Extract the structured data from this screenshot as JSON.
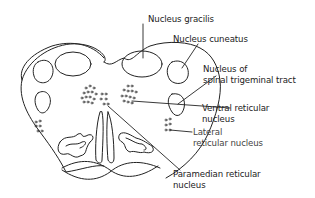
{
  "figure": {
    "type": "anatomical cross-section",
    "stroke_color": "#222222",
    "background": "#ffffff"
  },
  "labels": [
    {
      "id": "gracilis",
      "lines": [
        "Nucleus gracilis"
      ]
    },
    {
      "id": "cuneatus",
      "lines": [
        "Nucleus cuneatus"
      ]
    },
    {
      "id": "spinal-trigeminal",
      "lines": [
        "Nucleus of",
        "spinal trigeminal tract"
      ]
    },
    {
      "id": "ventral-reticular",
      "lines": [
        "Ventral reticular",
        "nucleus"
      ]
    },
    {
      "id": "lateral-reticular",
      "lines": [
        "Lateral",
        "reticular nucleus"
      ]
    },
    {
      "id": "paramedian-reticular",
      "lines": [
        "Paramedian reticular",
        "nucleus"
      ]
    }
  ]
}
